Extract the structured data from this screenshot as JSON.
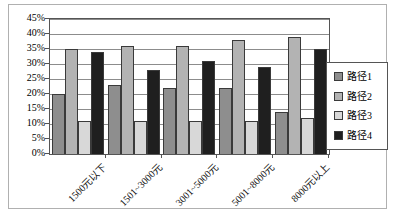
{
  "chart_data": {
    "type": "bar",
    "title": "",
    "xlabel": "",
    "ylabel": "",
    "categories": [
      "1500元以下",
      "1501~3000元",
      "3001~5000元",
      "5001~8000元",
      "8000元以上"
    ],
    "series": [
      {
        "name": "路径1",
        "color": "#8e8e8e",
        "values": [
          20,
          23,
          22,
          22,
          14
        ]
      },
      {
        "name": "路径2",
        "color": "#b3b3b3",
        "values": [
          35,
          36,
          36,
          38,
          39
        ]
      },
      {
        "name": "路径3",
        "color": "#d8d8d8",
        "values": [
          11,
          11,
          11,
          11,
          12
        ]
      },
      {
        "name": "路径4",
        "color": "#1f1f1f",
        "values": [
          34,
          28,
          31,
          29,
          35
        ]
      }
    ],
    "ylim": [
      0,
      45
    ],
    "ytick_step": 5,
    "ytick_labels": [
      "0%",
      "5%",
      "10%",
      "15%",
      "20%",
      "25%",
      "30%",
      "35%",
      "40%",
      "45%"
    ],
    "grid": true,
    "legend_position": "right",
    "colors": {
      "gridline": "#8c8c8c",
      "plot_border": "#555555",
      "bar_outline": "#3a3a3a",
      "frame_border": "#b0b0b0",
      "background": "#ffffff"
    }
  }
}
